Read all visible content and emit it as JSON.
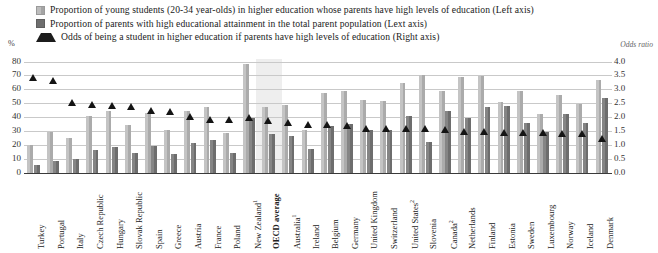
{
  "legend": {
    "items": [
      {
        "marker": "light-square-swatch",
        "text": "Proportion of young students (20-34 year-olds) in higher education whose parents have high levels of education (Left axis)"
      },
      {
        "marker": "dark-square-swatch",
        "text": "Proportion of parents with high educational attainment in the total parent population (Lext axis)"
      },
      {
        "marker": "triangle-marker",
        "text": "Odds of being a student in higher education if parents have high levels of education (Right axis)"
      }
    ]
  },
  "axes": {
    "left_unit": "%",
    "right_title": "Odds ratio",
    "left_ticks": [
      "0",
      "10",
      "20",
      "30",
      "40",
      "50",
      "60",
      "70",
      "80"
    ],
    "right_ticks": [
      "0.0",
      "0.5",
      "1.0",
      "1.5",
      "2.0",
      "2.5",
      "3.0",
      "3.5",
      "4.0"
    ]
  },
  "chart_data": {
    "type": "bar",
    "title": "",
    "xlabel": "",
    "ylabel": "%",
    "y2label": "Odds ratio",
    "ylim": [
      0,
      80
    ],
    "y2lim": [
      0,
      4.0
    ],
    "grid": true,
    "legend_position": "top",
    "highlight_category": "OECD average",
    "categories": [
      "Turkey",
      "Portugal",
      "Italy",
      "Czech Republic",
      "Hungary",
      "Slovak Republic",
      "Spain",
      "Greece",
      "Austria",
      "France",
      "Poland",
      "New Zealand¹",
      "OECD average",
      "Australia¹",
      "Ireland",
      "Belgium",
      "Germany",
      "United Kingdom",
      "Switzerland",
      "United States²",
      "Slovenia",
      "Canada²",
      "Netherlands",
      "Finland",
      "Estonia",
      "Sweden",
      "Luxembourg",
      "Norway",
      "Iceland",
      "Denmark"
    ],
    "series": [
      {
        "name": "Proportion of young students (20-34 year-olds) in higher education whose parents have high levels of education",
        "axis": "left",
        "color": "#b9b9b9",
        "values": [
          20.0,
          29.5,
          25.0,
          41.0,
          44.5,
          34.5,
          43.0,
          31.0,
          44.0,
          47.0,
          28.5,
          78.0,
          47.5,
          49.0,
          31.0,
          57.0,
          59.0,
          52.0,
          51.5,
          64.5,
          70.5,
          59.0,
          69.0,
          69.5,
          51.0,
          58.5,
          42.0,
          56.0,
          49.5,
          66.5
        ]
      },
      {
        "name": "Proportion of parents with high educational attainment in the total parent population",
        "axis": "left",
        "color": "#7a7a7a",
        "values": [
          5.5,
          8.5,
          10.0,
          16.5,
          18.5,
          14.0,
          19.0,
          13.5,
          21.5,
          23.5,
          14.0,
          39.5,
          27.5,
          26.0,
          17.0,
          33.5,
          35.0,
          31.0,
          30.5,
          41.0,
          22.0,
          44.5,
          39.0,
          47.5,
          48.0,
          35.5,
          29.5,
          42.0,
          35.5,
          53.5
        ]
      },
      {
        "name": "Odds of being a student in higher education if parents have high levels of education",
        "axis": "right",
        "marker": "triangle",
        "color": "#141414",
        "values": [
          3.4,
          3.28,
          2.5,
          2.42,
          2.38,
          2.36,
          2.21,
          2.18,
          2.0,
          1.9,
          1.9,
          1.97,
          1.85,
          1.79,
          1.71,
          1.7,
          1.68,
          1.57,
          1.56,
          1.56,
          1.55,
          1.53,
          1.46,
          1.45,
          1.44,
          1.42,
          1.43,
          1.39,
          1.37,
          1.22
        ]
      }
    ]
  }
}
